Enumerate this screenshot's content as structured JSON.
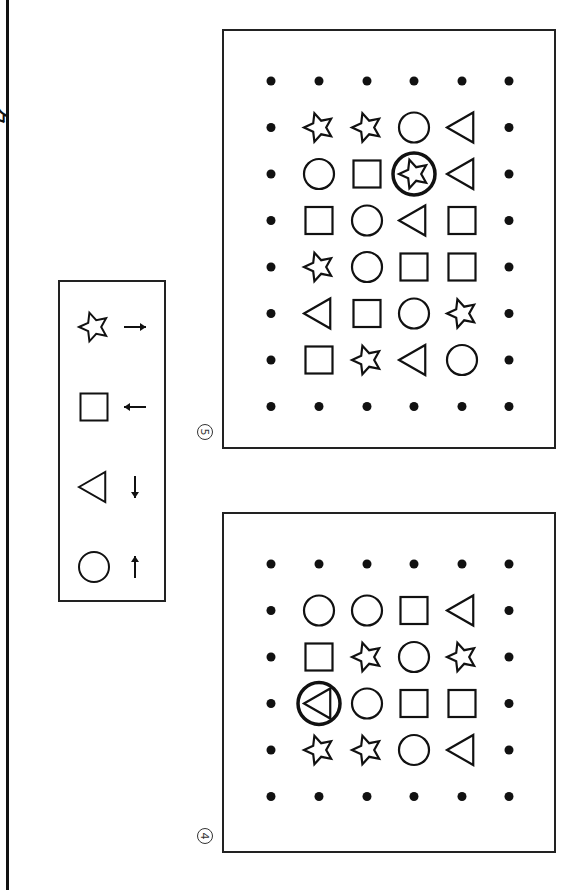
{
  "page": {
    "cut_text": "ク"
  },
  "legend": {
    "items": [
      {
        "shape": "star",
        "arrow": "right"
      },
      {
        "shape": "square",
        "arrow": "left"
      },
      {
        "shape": "triangle",
        "arrow": "down"
      },
      {
        "shape": "circle",
        "arrow": "up"
      }
    ]
  },
  "boards": [
    {
      "label": "5",
      "top": 29,
      "height": 420,
      "rows": [
        [
          "star",
          "star",
          "circle",
          "triangle"
        ],
        [
          "circle",
          "square",
          "star",
          "triangle"
        ],
        [
          "square",
          "circle",
          "triangle",
          "square"
        ],
        [
          "star",
          "circle",
          "square",
          "square"
        ],
        [
          "triangle",
          "square",
          "circle",
          "star"
        ],
        [
          "square",
          "star",
          "triangle",
          "circle"
        ]
      ],
      "highlight": {
        "row": 1,
        "col": 2
      }
    },
    {
      "label": "4",
      "top": 512,
      "height": 341,
      "rows": [
        [
          "circle",
          "circle",
          "square",
          "triangle"
        ],
        [
          "square",
          "star",
          "circle",
          "star"
        ],
        [
          "triangle",
          "circle",
          "square",
          "square"
        ],
        [
          "star",
          "star",
          "circle",
          "triangle"
        ]
      ],
      "highlight": {
        "row": 2,
        "col": 0
      }
    }
  ]
}
